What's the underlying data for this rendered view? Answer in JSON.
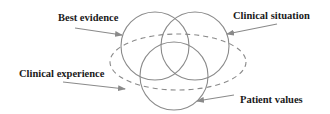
{
  "diagram": {
    "type": "venn",
    "colors": {
      "circle_stroke": "#8a8a8a",
      "ellipse_stroke": "#8a8a8a",
      "arrow": "#8a8a8a",
      "text": "#1a1a1a",
      "background": "#ffffff"
    },
    "sets": [
      {
        "id": "best-evidence",
        "label": "Best evidence",
        "shape": "circle",
        "style": "solid"
      },
      {
        "id": "clinical-situation",
        "label": "Clinical situation",
        "shape": "circle",
        "style": "solid"
      },
      {
        "id": "patient-values",
        "label": "Patient values",
        "shape": "circle",
        "style": "solid"
      },
      {
        "id": "clinical-experience",
        "label": "Clinical experience",
        "shape": "ellipse",
        "style": "dashed"
      }
    ],
    "labels": {
      "best_evidence": "Best evidence",
      "clinical_situation": "Clinical situation",
      "clinical_experience": "Clinical experience",
      "patient_values": "Patient values"
    }
  }
}
